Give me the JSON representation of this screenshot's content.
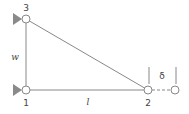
{
  "diagram": {
    "type": "truss",
    "nodes": [
      {
        "id": "1",
        "label": "1",
        "x": 26,
        "y": 90,
        "support": "pin"
      },
      {
        "id": "2",
        "label": "2",
        "x": 148,
        "y": 90,
        "support": "none"
      },
      {
        "id": "3",
        "label": "3",
        "x": 26,
        "y": 19,
        "support": "pin"
      }
    ],
    "displaced_node": {
      "x": 175,
      "y": 90
    },
    "members": [
      {
        "from": "1",
        "to": "2",
        "label": "l"
      },
      {
        "from": "1",
        "to": "3",
        "label": "w"
      },
      {
        "from": "3",
        "to": "2",
        "label": ""
      }
    ],
    "displacement_label": "δ",
    "colors": {
      "line": "#888888",
      "support": "#8a8a8a",
      "text": "#444444",
      "node_fill": "#ffffff"
    }
  }
}
